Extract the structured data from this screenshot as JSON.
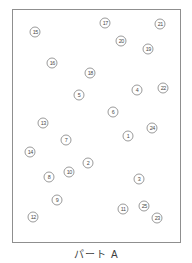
{
  "caption": {
    "text": "パート A"
  },
  "board": {
    "circle_count": 25,
    "number_range": [
      1,
      25
    ],
    "circles": [
      {
        "n": "1",
        "x": 128,
        "y": 136
      },
      {
        "n": "2",
        "x": 88,
        "y": 163
      },
      {
        "n": "3",
        "x": 139,
        "y": 179
      },
      {
        "n": "4",
        "x": 137,
        "y": 90
      },
      {
        "n": "5",
        "x": 79,
        "y": 95
      },
      {
        "n": "6",
        "x": 113,
        "y": 112
      },
      {
        "n": "7",
        "x": 66,
        "y": 140
      },
      {
        "n": "8",
        "x": 49,
        "y": 177
      },
      {
        "n": "9",
        "x": 57,
        "y": 200
      },
      {
        "n": "10",
        "x": 69,
        "y": 172
      },
      {
        "n": "11",
        "x": 123,
        "y": 209
      },
      {
        "n": "12",
        "x": 33,
        "y": 217
      },
      {
        "n": "13",
        "x": 43,
        "y": 123
      },
      {
        "n": "14",
        "x": 30,
        "y": 152
      },
      {
        "n": "15",
        "x": 35,
        "y": 32
      },
      {
        "n": "16",
        "x": 52,
        "y": 63
      },
      {
        "n": "17",
        "x": 105,
        "y": 23
      },
      {
        "n": "18",
        "x": 90,
        "y": 73
      },
      {
        "n": "19",
        "x": 148,
        "y": 49
      },
      {
        "n": "20",
        "x": 121,
        "y": 41
      },
      {
        "n": "21",
        "x": 160,
        "y": 24
      },
      {
        "n": "22",
        "x": 163,
        "y": 88
      },
      {
        "n": "23",
        "x": 157,
        "y": 218
      },
      {
        "n": "24",
        "x": 152,
        "y": 128
      },
      {
        "n": "25",
        "x": 144,
        "y": 206
      }
    ]
  },
  "colors": {
    "background": "#ffffff",
    "box_border": "#8f8f8f",
    "circle_stroke": "#9a9a9a",
    "number_text": "#4a4a4a",
    "caption_text": "#3d3d3d"
  }
}
